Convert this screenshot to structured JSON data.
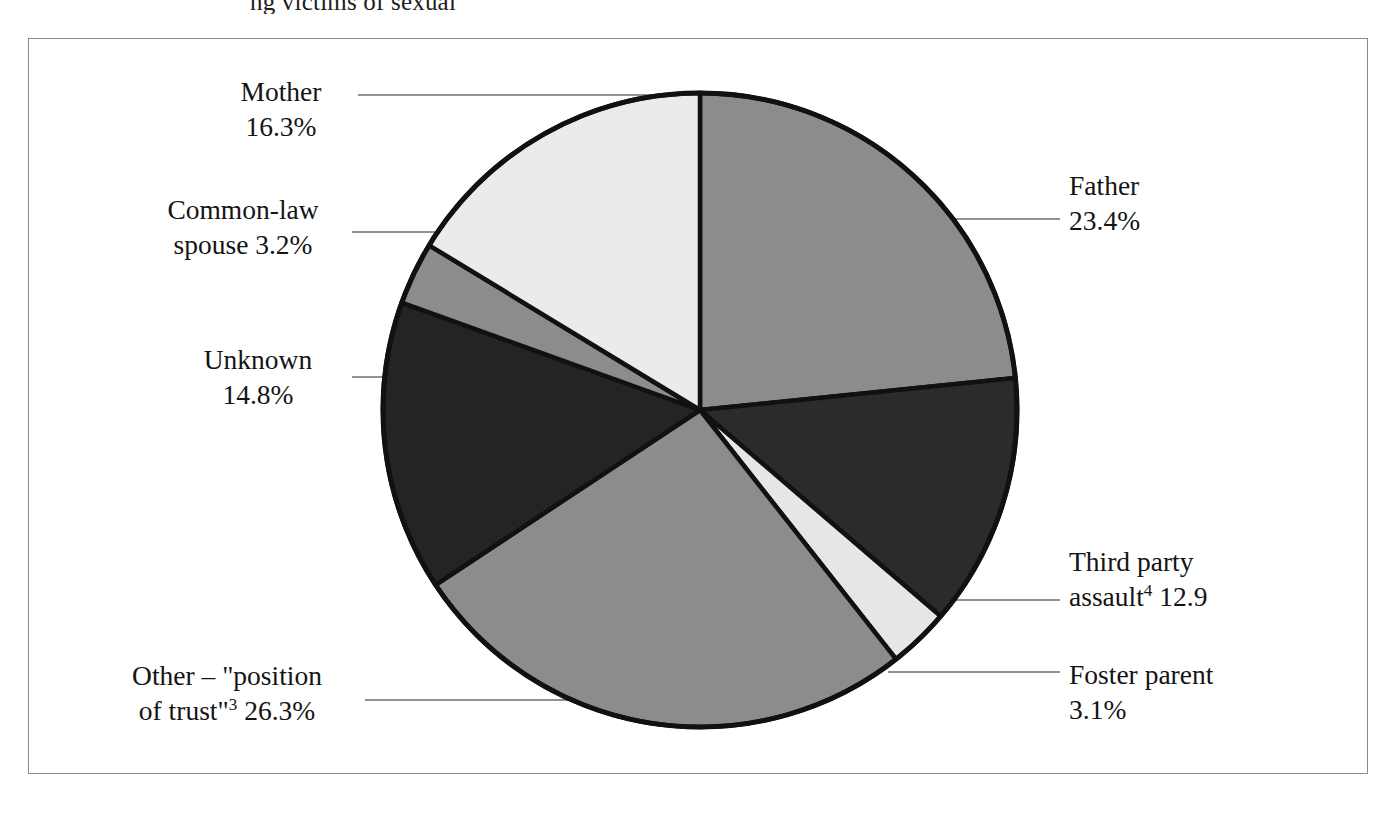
{
  "figure": {
    "top_clipped_text": "ng victims of sexual"
  },
  "chart_data": {
    "type": "pie",
    "title": "",
    "start_angle_deg": 0,
    "direction": "clockwise",
    "legend": "none",
    "labels_outside": true,
    "categories": [
      "Father",
      "Third party assault",
      "Foster parent",
      "Other – \"position of trust\"",
      "Unknown",
      "Common-law spouse",
      "Mother"
    ],
    "values": [
      23.4,
      12.9,
      3.1,
      26.3,
      14.8,
      3.2,
      16.3
    ],
    "unit": "%",
    "colors": [
      "#8c8c8c",
      "#2b2b2b",
      "#e6e6e6",
      "#8c8c8c",
      "#242424",
      "#8c8c8c",
      "#ebebeb"
    ],
    "slices": [
      {
        "name": "father",
        "label_line1": "Father",
        "label_line2": "23.4%",
        "value": 23.4,
        "color": "#8c8c8c",
        "start_deg": 0,
        "end_deg": 84.2
      },
      {
        "name": "third-party-assault",
        "label_line1": "Third party",
        "label_line2_pre": "assault",
        "label_line2_sup": "4",
        "label_line2_post": " 12.9",
        "value": 12.9,
        "color": "#2b2b2b",
        "start_deg": 84.2,
        "end_deg": 130.6
      },
      {
        "name": "foster-parent",
        "label_line1": "Foster parent",
        "label_line2": "3.1%",
        "value": 3.1,
        "color": "#e6e6e6",
        "start_deg": 130.6,
        "end_deg": 141.8
      },
      {
        "name": "other-position-of-trust",
        "label_line1": "Other – \"position",
        "label_line2_pre": "of trust\"",
        "label_line2_sup": "3",
        "label_line2_post": " 26.3%",
        "value": 26.3,
        "color": "#8c8c8c",
        "start_deg": 141.8,
        "end_deg": 236.5
      },
      {
        "name": "unknown",
        "label_line1": "Unknown",
        "label_line2": "14.8%",
        "value": 14.8,
        "color": "#242424",
        "start_deg": 236.5,
        "end_deg": 289.8
      },
      {
        "name": "common-law-spouse",
        "label_line1": "Common-law",
        "label_line2": "spouse 3.2%",
        "value": 3.2,
        "color": "#8c8c8c",
        "start_deg": 289.8,
        "end_deg": 301.3
      },
      {
        "name": "mother",
        "label_line1": "Mother",
        "label_line2": "16.3%",
        "value": 16.3,
        "color": "#ebebeb",
        "start_deg": 301.3,
        "end_deg": 360
      }
    ]
  }
}
